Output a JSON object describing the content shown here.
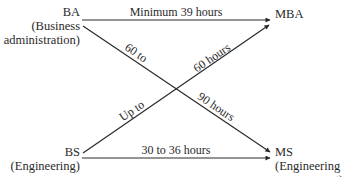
{
  "nodes": {
    "ba": {
      "title": "BA",
      "subtitle_line1": "(Business",
      "subtitle_line2": "administration)"
    },
    "bs": {
      "title": "BS",
      "subtitle_line1": "(Engineering)"
    },
    "mba": {
      "title": "MBA"
    },
    "ms": {
      "title": "MS",
      "subtitle_line1": "(Engineering",
      "subtitle_line2": "management)"
    }
  },
  "edges": [
    {
      "from": "BA",
      "to": "MBA",
      "label": "Minimum 39 hours"
    },
    {
      "from": "BA",
      "to": "MS",
      "label_part1": "60 to",
      "label_part2": "90 hours"
    },
    {
      "from": "BS",
      "to": "MBA",
      "label_part1": "Up to",
      "label_part2": "60 hours"
    },
    {
      "from": "BS",
      "to": "MS",
      "label": "30 to 36 hours"
    }
  ],
  "colors": {
    "line": "#2a2a2a",
    "text": "#2a2a2a",
    "background": "#ffffff"
  }
}
